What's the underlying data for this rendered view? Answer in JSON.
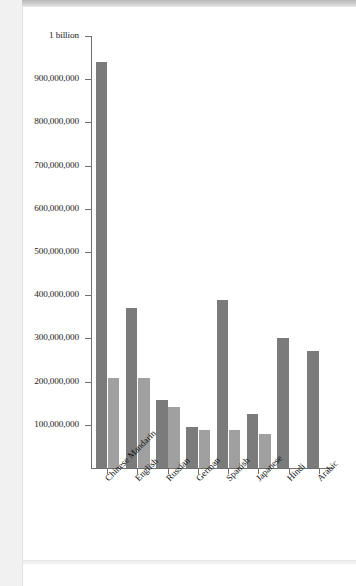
{
  "page": {
    "background_color": "#ffffff",
    "card_color": "#ffffff"
  },
  "chart_data": {
    "type": "bar",
    "title": "",
    "subtitle": "",
    "xlabel": "",
    "ylabel": "",
    "grid": false,
    "legend_position": "none",
    "ylim": [
      0,
      1000000000
    ],
    "y_tick_values": [
      1000000000,
      900000000,
      800000000,
      700000000,
      600000000,
      500000000,
      400000000,
      300000000,
      200000000,
      100000000
    ],
    "y_tick_labels": [
      "1 billion",
      "900,000,000",
      "800,000,000",
      "700,000,000",
      "600,000,000",
      "500,000,000",
      "400,000,000",
      "300,000,000",
      "200,000,000",
      "100,000,000"
    ],
    "categories": [
      "Chinese Mandarin",
      "English",
      "Russian",
      "German",
      "Spanish",
      "Japanese",
      "Hindi",
      "Arabic"
    ],
    "series": [
      {
        "name": "primary",
        "color": "#7b7b7b",
        "values": [
          940000000,
          370000000,
          158000000,
          95000000,
          390000000,
          126000000,
          302000000,
          272000000
        ]
      },
      {
        "name": "secondary",
        "color": "#a0a0a0",
        "values": [
          208000000,
          208000000,
          141000000,
          87000000,
          87000000,
          78000000,
          null,
          null
        ]
      }
    ]
  },
  "axes": {
    "axis_color": "#6f6f6f"
  }
}
